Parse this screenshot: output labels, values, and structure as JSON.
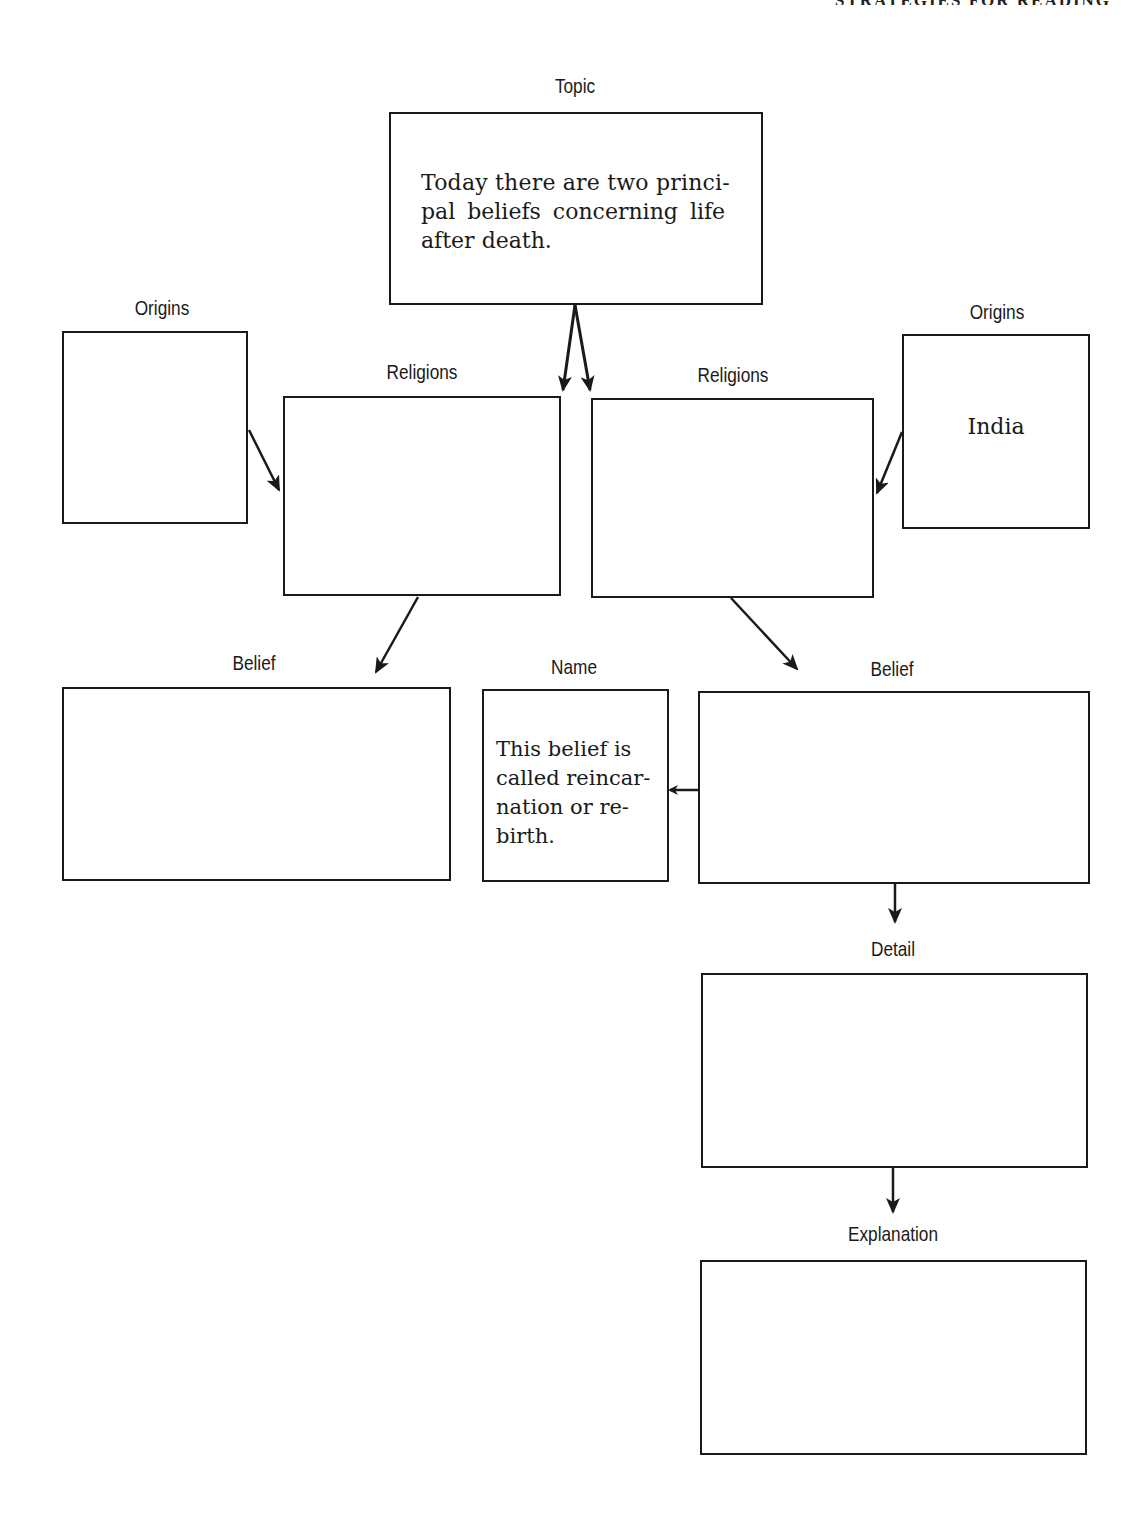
{
  "page": {
    "running_head": "STRATEGIES FOR READING"
  },
  "diagram": {
    "topic": {
      "label": "Topic",
      "text_lines": [
        "Today there are two princi-",
        "pal beliefs concerning life",
        "after death."
      ]
    },
    "left_branch": {
      "origins": {
        "label": "Origins",
        "text": ""
      },
      "religions": {
        "label": "Religions",
        "text": ""
      },
      "belief": {
        "label": "Belief",
        "text": ""
      }
    },
    "right_branch": {
      "origins": {
        "label": "Origins",
        "text": "India"
      },
      "religions": {
        "label": "Religions",
        "text": ""
      },
      "belief": {
        "label": "Belief",
        "text": ""
      },
      "name": {
        "label": "Name",
        "text_lines": [
          "This belief is",
          "called reincar-",
          "nation or re-",
          "birth."
        ]
      },
      "detail": {
        "label": "Detail",
        "text": ""
      },
      "explanation": {
        "label": "Explanation",
        "text": ""
      }
    },
    "colors": {
      "ink": "#1a1a1a",
      "paper": "#ffffff"
    }
  }
}
